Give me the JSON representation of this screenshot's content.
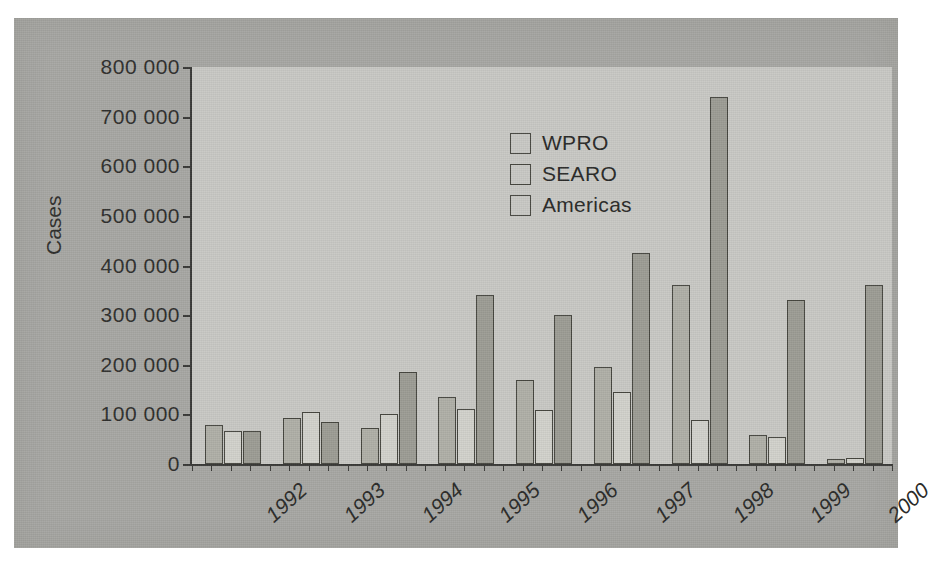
{
  "chart_data": {
    "type": "bar",
    "title": "",
    "xlabel": "",
    "ylabel": "Cases",
    "ylim": [
      0,
      800000
    ],
    "ytick_step": 100000,
    "ytick_labels": [
      "800 000",
      "700 000",
      "600 000",
      "500 000",
      "400 000",
      "300 000",
      "200 000",
      "100 000",
      "0"
    ],
    "ytick_values": [
      800000,
      700000,
      600000,
      500000,
      400000,
      300000,
      200000,
      100000,
      0
    ],
    "grid": false,
    "legend_position": "upper-left-inside",
    "categories": [
      "1992",
      "1993",
      "1994",
      "1995",
      "1996",
      "1997",
      "1998",
      "1999",
      "2000"
    ],
    "series": [
      {
        "name": "WPRO",
        "color": "#b0b0a8",
        "values": [
          78000,
          92000,
          72000,
          135000,
          170000,
          195000,
          360000,
          58000,
          10000
        ]
      },
      {
        "name": "SEARO",
        "color": "#d2d2cc",
        "values": [
          66000,
          105000,
          100000,
          110000,
          108000,
          145000,
          88000,
          55000,
          12000
        ]
      },
      {
        "name": "Americas",
        "color": "#9d9d95",
        "values": [
          66000,
          85000,
          185000,
          340000,
          300000,
          425000,
          740000,
          330000,
          360000
        ]
      }
    ]
  },
  "legend": {
    "items": [
      {
        "label": "WPRO"
      },
      {
        "label": "SEARO"
      },
      {
        "label": "Americas"
      }
    ]
  },
  "axes": {
    "y_title": "Cases"
  }
}
